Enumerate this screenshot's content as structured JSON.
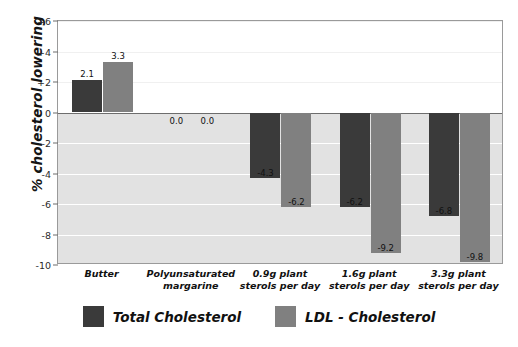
{
  "chart_data": {
    "type": "bar",
    "title": "",
    "xlabel": "",
    "ylabel": "% cholesterol lowering",
    "categories": [
      "Butter",
      "Polyunsaturated margarine",
      "0.9g plant sterols per day",
      "1.6g plant sterols per day",
      "3.3g plant sterols per day"
    ],
    "category_lines": [
      [
        "Butter"
      ],
      [
        "Polyunsaturated",
        "margarine"
      ],
      [
        "0.9g plant",
        "sterols per day"
      ],
      [
        "1.6g plant",
        "sterols per day"
      ],
      [
        "3.3g plant",
        "sterols per day"
      ]
    ],
    "series": [
      {
        "name": "Total Cholesterol",
        "color": "#3a3a3a",
        "values": [
          2.1,
          0.0,
          -4.3,
          -6.2,
          -6.8
        ],
        "labels": [
          "2.1",
          "0.0",
          "-4.3",
          "-6.2",
          "-6.8"
        ]
      },
      {
        "name": "LDL - Cholesterol",
        "color": "#808080",
        "values": [
          3.3,
          0.0,
          -6.2,
          -9.2,
          -9.8
        ],
        "labels": [
          "3.3",
          "0.0",
          "-6.2",
          "-9.2",
          "-9.8"
        ]
      }
    ],
    "ylim": [
      -10,
      6
    ],
    "yticks": [
      6,
      4,
      2,
      0,
      -2,
      -4,
      -6,
      -8,
      -10
    ],
    "ytick_labels": [
      "+6",
      "+4",
      "+2",
      "0",
      "-2",
      "-4",
      "-6",
      "-8",
      "-10"
    ],
    "grid": true,
    "legend_position": "bottom"
  },
  "legend": {
    "items": [
      {
        "label": "Total Cholesterol",
        "color": "#3a3a3a"
      },
      {
        "label": "LDL - Cholesterol",
        "color": "#808080"
      }
    ]
  }
}
